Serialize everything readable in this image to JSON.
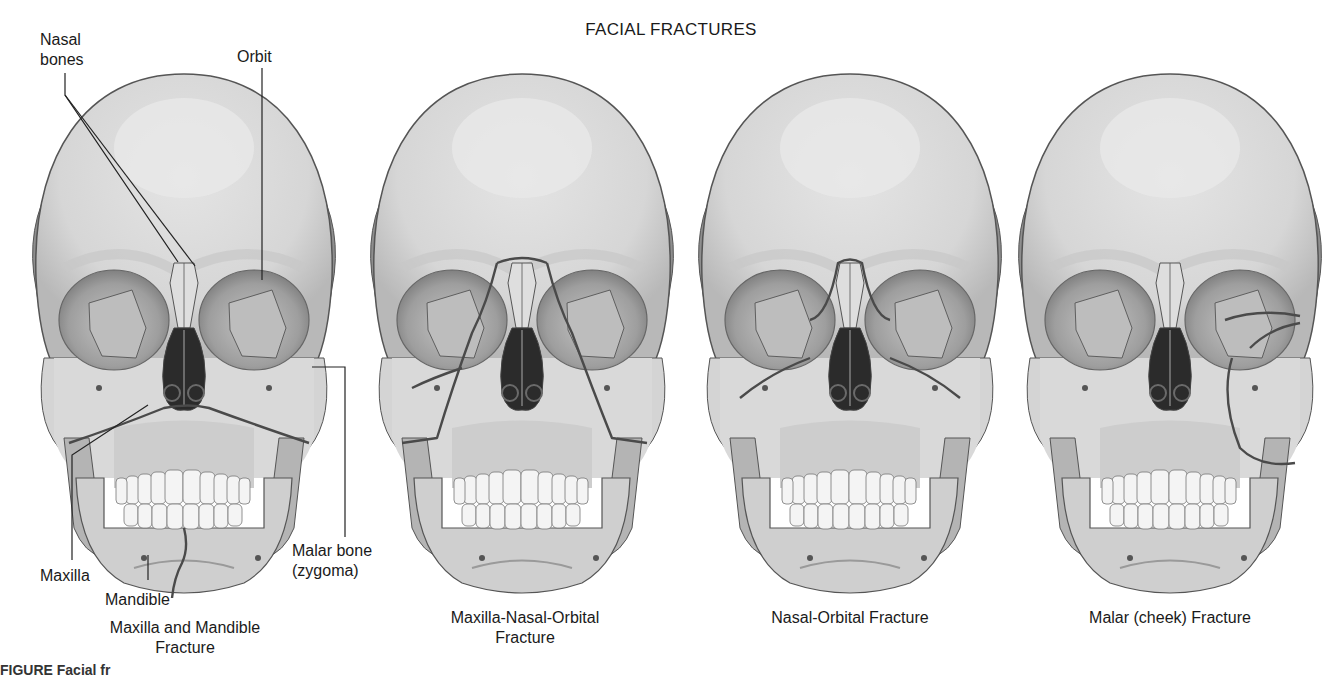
{
  "title": "FACIAL FRACTURES",
  "colors": {
    "bone": "#dcdcdc",
    "bone_shadow": "#a9a9a9",
    "bone_dark": "#7a7a7a",
    "outline": "#555555",
    "fracture": "#4a4a4a",
    "cavity": "#2a2a2a",
    "teeth": "#f4f4f4"
  },
  "labels": {
    "nasal_bones": "Nasal bones",
    "orbit": "Orbit",
    "maxilla": "Maxilla",
    "mandible": "Mandible",
    "malar_bone_line1": "Malar bone",
    "malar_bone_line2": "(zygoma)"
  },
  "panels": [
    {
      "caption_line1": "Maxilla and Mandible",
      "caption_line2": "Fracture",
      "fracture_type": "maxilla-mandible"
    },
    {
      "caption_line1": "Maxilla-Nasal-Orbital",
      "caption_line2": "Fracture",
      "fracture_type": "maxilla-nasal-orbital"
    },
    {
      "caption_line1": "Nasal-Orbital Fracture",
      "caption_line2": "",
      "fracture_type": "nasal-orbital"
    },
    {
      "caption_line1": "Malar (cheek) Fracture",
      "caption_line2": "",
      "fracture_type": "malar"
    }
  ],
  "figure_caption_partial": "FIGURE    Facial fr"
}
